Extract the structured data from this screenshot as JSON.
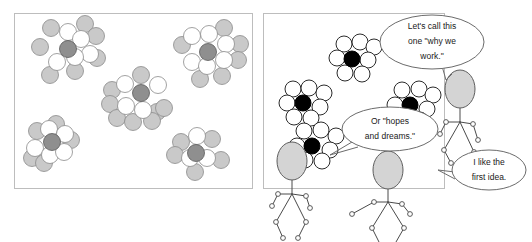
{
  "figure": {
    "background_color": "#ffffff",
    "panel_border_color": "#bdbdbd"
  },
  "panels": [
    {
      "id": "left-panel",
      "label": "Left panel: shaded clusters",
      "x": 14,
      "y": 13,
      "width": 238,
      "height": 175,
      "style": "shaded",
      "colors": {
        "shell_gray": "#c9c9c9",
        "shell_white": "#ffffff",
        "center": "#8f8f8f",
        "outline": "#8a8a8a"
      },
      "clusters": [
        {
          "name": "cluster-top-left",
          "center": [
            68,
            49
          ],
          "center_radius": 8.5,
          "shell": [
            {
              "cx": 51,
              "cy": 28,
              "r": 8.5,
              "tone": "gray"
            },
            {
              "cx": 68,
              "cy": 32,
              "r": 8.5,
              "tone": "white"
            },
            {
              "cx": 85,
              "cy": 24,
              "r": 8.5,
              "tone": "gray"
            },
            {
              "cx": 81,
              "cy": 39,
              "r": 8.5,
              "tone": "white"
            },
            {
              "cx": 96,
              "cy": 36,
              "r": 8.5,
              "tone": "gray"
            },
            {
              "cx": 40,
              "cy": 47,
              "r": 8.5,
              "tone": "gray"
            },
            {
              "cx": 57,
              "cy": 62,
              "r": 8.5,
              "tone": "white"
            },
            {
              "cx": 75,
              "cy": 57,
              "r": 8.5,
              "tone": "white"
            },
            {
              "cx": 90,
              "cy": 54,
              "r": 8.5,
              "tone": "white"
            },
            {
              "cx": 97,
              "cy": 58,
              "r": 8.5,
              "tone": "gray"
            },
            {
              "cx": 75,
              "cy": 71,
              "r": 8.5,
              "tone": "gray"
            },
            {
              "cx": 50,
              "cy": 75,
              "r": 8.5,
              "tone": "gray"
            }
          ]
        },
        {
          "name": "cluster-top-right",
          "center": [
            208,
            52
          ],
          "center_radius": 8.5,
          "shell": [
            {
              "cx": 192,
              "cy": 36,
              "r": 8.5,
              "tone": "white"
            },
            {
              "cx": 209,
              "cy": 34,
              "r": 8.5,
              "tone": "white"
            },
            {
              "cx": 224,
              "cy": 28,
              "r": 8.5,
              "tone": "gray"
            },
            {
              "cx": 226,
              "cy": 44,
              "r": 8.5,
              "tone": "white"
            },
            {
              "cx": 240,
              "cy": 44,
              "r": 8.5,
              "tone": "gray"
            },
            {
              "cx": 182,
              "cy": 45,
              "r": 8.5,
              "tone": "gray"
            },
            {
              "cx": 192,
              "cy": 62,
              "r": 8.5,
              "tone": "white"
            },
            {
              "cx": 207,
              "cy": 66,
              "r": 8.5,
              "tone": "white"
            },
            {
              "cx": 224,
              "cy": 60,
              "r": 8.5,
              "tone": "white"
            },
            {
              "cx": 238,
              "cy": 60,
              "r": 8.5,
              "tone": "gray"
            },
            {
              "cx": 200,
              "cy": 79,
              "r": 8.5,
              "tone": "gray"
            },
            {
              "cx": 222,
              "cy": 76,
              "r": 8.5,
              "tone": "gray"
            }
          ]
        },
        {
          "name": "cluster-center",
          "center": [
            141,
            93
          ],
          "center_radius": 8.5,
          "shell": [
            {
              "cx": 141,
              "cy": 75,
              "r": 8.5,
              "tone": "gray"
            },
            {
              "cx": 125,
              "cy": 84,
              "r": 8.5,
              "tone": "white"
            },
            {
              "cx": 158,
              "cy": 85,
              "r": 8.5,
              "tone": "white"
            },
            {
              "cx": 112,
              "cy": 90,
              "r": 8.5,
              "tone": "gray"
            },
            {
              "cx": 110,
              "cy": 104,
              "r": 8.5,
              "tone": "gray"
            },
            {
              "cx": 126,
              "cy": 106,
              "r": 8.5,
              "tone": "white"
            },
            {
              "cx": 143,
              "cy": 110,
              "r": 8.5,
              "tone": "white"
            },
            {
              "cx": 157,
              "cy": 112,
              "r": 8.5,
              "tone": "gray"
            },
            {
              "cx": 164,
              "cy": 108,
              "r": 8.5,
              "tone": "gray"
            },
            {
              "cx": 117,
              "cy": 118,
              "r": 8.5,
              "tone": "gray"
            },
            {
              "cx": 133,
              "cy": 122,
              "r": 8.5,
              "tone": "gray"
            },
            {
              "cx": 152,
              "cy": 121,
              "r": 8.5,
              "tone": "gray"
            }
          ]
        },
        {
          "name": "cluster-bottom-left",
          "center": [
            52,
            142
          ],
          "center_radius": 8.5,
          "shell": [
            {
              "cx": 56,
              "cy": 124,
              "r": 8.5,
              "tone": "gray"
            },
            {
              "cx": 37,
              "cy": 131,
              "r": 8.5,
              "tone": "gray"
            },
            {
              "cx": 49,
              "cy": 129,
              "r": 8.5,
              "tone": "white"
            },
            {
              "cx": 65,
              "cy": 134,
              "r": 8.5,
              "tone": "white"
            },
            {
              "cx": 71,
              "cy": 140,
              "r": 8.5,
              "tone": "gray"
            },
            {
              "cx": 35,
              "cy": 148,
              "r": 8.5,
              "tone": "white"
            },
            {
              "cx": 50,
              "cy": 155,
              "r": 8.5,
              "tone": "white"
            },
            {
              "cx": 64,
              "cy": 152,
              "r": 8.5,
              "tone": "white"
            },
            {
              "cx": 32,
              "cy": 158,
              "r": 8.5,
              "tone": "gray"
            },
            {
              "cx": 44,
              "cy": 163,
              "r": 8.5,
              "tone": "gray"
            }
          ]
        },
        {
          "name": "cluster-bottom-right",
          "center": [
            196,
            153
          ],
          "center_radius": 8.5,
          "shell": [
            {
              "cx": 197,
              "cy": 136,
              "r": 8.5,
              "tone": "white"
            },
            {
              "cx": 181,
              "cy": 142,
              "r": 8.5,
              "tone": "gray"
            },
            {
              "cx": 212,
              "cy": 139,
              "r": 8.5,
              "tone": "gray"
            },
            {
              "cx": 175,
              "cy": 155,
              "r": 8.5,
              "tone": "gray"
            },
            {
              "cx": 190,
              "cy": 158,
              "r": 8.5,
              "tone": "white"
            },
            {
              "cx": 207,
              "cy": 158,
              "r": 8.5,
              "tone": "white"
            },
            {
              "cx": 221,
              "cy": 160,
              "r": 8.5,
              "tone": "gray"
            },
            {
              "cx": 195,
              "cy": 172,
              "r": 8.5,
              "tone": "gray"
            }
          ]
        }
      ]
    },
    {
      "id": "right-panel",
      "label": "Right panel: outline clusters with speakers",
      "x": 263,
      "y": 13,
      "width": 181,
      "height": 175,
      "style": "outline",
      "colors": {
        "shell": "#ffffff",
        "center": "#000000",
        "outline": "#2b2b2b"
      },
      "clusters": [
        {
          "name": "cluster-upper",
          "center": [
            352,
            59
          ],
          "center_radius": 8,
          "shell": [
            {
              "cx": 344,
              "cy": 44,
              "r": 8
            },
            {
              "cx": 360,
              "cy": 42,
              "r": 8
            },
            {
              "cx": 374,
              "cy": 47,
              "r": 8
            },
            {
              "cx": 337,
              "cy": 58,
              "r": 8
            },
            {
              "cx": 368,
              "cy": 60,
              "r": 8
            },
            {
              "cx": 345,
              "cy": 73,
              "r": 8
            },
            {
              "cx": 362,
              "cy": 74,
              "r": 8
            }
          ]
        },
        {
          "name": "cluster-left",
          "center": [
            303,
            103
          ],
          "center_radius": 8,
          "shell": [
            {
              "cx": 293,
              "cy": 89,
              "r": 8
            },
            {
              "cx": 309,
              "cy": 88,
              "r": 8
            },
            {
              "cx": 324,
              "cy": 93,
              "r": 8
            },
            {
              "cx": 287,
              "cy": 103,
              "r": 8
            },
            {
              "cx": 320,
              "cy": 107,
              "r": 8
            },
            {
              "cx": 294,
              "cy": 117,
              "r": 8
            },
            {
              "cx": 311,
              "cy": 118,
              "r": 8
            }
          ]
        },
        {
          "name": "cluster-lower",
          "center": [
            312,
            146
          ],
          "center_radius": 8,
          "shell": [
            {
              "cx": 304,
              "cy": 131,
              "r": 8
            },
            {
              "cx": 321,
              "cy": 130,
              "r": 8
            },
            {
              "cx": 336,
              "cy": 136,
              "r": 8
            },
            {
              "cx": 297,
              "cy": 146,
              "r": 8
            },
            {
              "cx": 330,
              "cy": 150,
              "r": 8
            },
            {
              "cx": 305,
              "cy": 160,
              "r": 8
            },
            {
              "cx": 322,
              "cy": 161,
              "r": 8
            }
          ]
        },
        {
          "name": "cluster-middle-right",
          "center": [
            410,
            105
          ],
          "center_radius": 8,
          "shell": [
            {
              "cx": 402,
              "cy": 90,
              "r": 8
            },
            {
              "cx": 419,
              "cy": 89,
              "r": 8
            },
            {
              "cx": 433,
              "cy": 95,
              "r": 8
            },
            {
              "cx": 395,
              "cy": 105,
              "r": 8
            },
            {
              "cx": 427,
              "cy": 109,
              "r": 8
            },
            {
              "cx": 403,
              "cy": 119,
              "r": 8
            },
            {
              "cx": 420,
              "cy": 120,
              "r": 8
            }
          ]
        }
      ]
    }
  ],
  "speech_bubbles": [
    {
      "name": "bubble-why-we-work",
      "speaker": "figure-right-upper",
      "cx": 432,
      "cy": 42,
      "rx": 52,
      "ry": 27,
      "lines": [
        "Let's call this",
        "one \"why we",
        "work.\""
      ],
      "tail": "442,66 446,80 452,74"
    },
    {
      "name": "bubble-hopes-and-dreams",
      "speaker": "figure-left-lower",
      "cx": 390,
      "cy": 129,
      "rx": 48,
      "ry": 22,
      "lines": [
        "Or \"hopes",
        "and dreams.\""
      ],
      "tail": "352,142 330,155 358,147"
    },
    {
      "name": "bubble-first-idea",
      "speaker": "figure-right-lower",
      "cx": 489,
      "cy": 170,
      "rx": 37,
      "ry": 20,
      "lines": [
        "I like the",
        "first idea."
      ],
      "tail": "455,172 438,170 455,179"
    }
  ],
  "figures": [
    {
      "name": "figure-right-upper",
      "head": {
        "cx": 460,
        "cy": 89,
        "rx": 15,
        "ry": 19
      },
      "joints": [
        [
          460,
          122
        ],
        [
          446,
          122
        ],
        [
          473,
          124
        ],
        [
          440,
          134
        ],
        [
          478,
          140
        ],
        [
          444,
          150
        ],
        [
          474,
          152
        ],
        [
          451,
          163
        ],
        [
          468,
          164
        ]
      ]
    },
    {
      "name": "figure-left-lower",
      "head": {
        "cx": 292,
        "cy": 161,
        "rx": 15,
        "ry": 19
      },
      "joints": [
        [
          292,
          194
        ],
        [
          278,
          194
        ],
        [
          306,
          196
        ],
        [
          272,
          206
        ],
        [
          310,
          208
        ],
        [
          276,
          222
        ],
        [
          306,
          222
        ],
        [
          283,
          238
        ],
        [
          298,
          238
        ]
      ]
    },
    {
      "name": "figure-right-lower",
      "head": {
        "cx": 388,
        "cy": 170,
        "rx": 15,
        "ry": 19
      },
      "joints": [
        [
          388,
          202
        ],
        [
          374,
          202
        ],
        [
          402,
          204
        ],
        [
          352,
          214
        ],
        [
          410,
          214
        ],
        [
          372,
          228
        ],
        [
          404,
          228
        ],
        [
          379,
          242
        ],
        [
          396,
          242
        ]
      ]
    }
  ]
}
